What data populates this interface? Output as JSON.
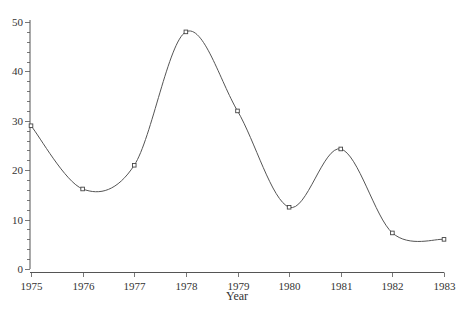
{
  "chart_data": {
    "type": "line",
    "title": "",
    "xlabel": "Year",
    "ylabel": "",
    "x": [
      1975,
      1976,
      1977,
      1978,
      1979,
      1980,
      1981,
      1982,
      1983
    ],
    "series": [
      {
        "name": "",
        "values": [
          29,
          16.2,
          21,
          48,
          32,
          12.5,
          24.3,
          7.3,
          6
        ],
        "smooth": true,
        "marker": "small-square"
      }
    ],
    "xticks": [
      "1975",
      "1976",
      "1977",
      "1978",
      "1979",
      "1980",
      "1981",
      "1982",
      "1983"
    ],
    "yticks": [
      "0",
      "10",
      "20",
      "30",
      "40",
      "50"
    ],
    "xlim": [
      1975,
      1983
    ],
    "ylim": [
      0,
      50
    ],
    "y_minor_ticks_per_major": 5,
    "grid": false,
    "legend": "none",
    "colors": {
      "line": "#555555",
      "axis": "#555555",
      "text": "#333333"
    }
  }
}
